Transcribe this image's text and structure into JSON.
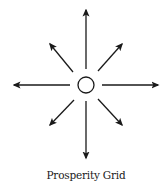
{
  "diagram": {
    "title": "Prosperity Grid",
    "stroke_color": "#1a1a1a",
    "background": "#ffffff",
    "center": {
      "x": 86,
      "y": 85,
      "r": 8,
      "icon": "circle-node"
    },
    "arrows": [
      {
        "direction": "north",
        "x1": 86,
        "y1": 69,
        "x2": 86,
        "y2": 10
      },
      {
        "direction": "south",
        "x1": 86,
        "y1": 101,
        "x2": 86,
        "y2": 158
      },
      {
        "direction": "west",
        "x1": 70,
        "y1": 85,
        "x2": 14,
        "y2": 85
      },
      {
        "direction": "east",
        "x1": 102,
        "y1": 85,
        "x2": 158,
        "y2": 85
      },
      {
        "direction": "north-west",
        "x1": 73,
        "y1": 72,
        "x2": 50,
        "y2": 44
      },
      {
        "direction": "north-east",
        "x1": 98,
        "y1": 71,
        "x2": 122,
        "y2": 44
      },
      {
        "direction": "south-west",
        "x1": 74,
        "y1": 100,
        "x2": 50,
        "y2": 125
      },
      {
        "direction": "south-east",
        "x1": 98,
        "y1": 99,
        "x2": 122,
        "y2": 125
      }
    ]
  }
}
